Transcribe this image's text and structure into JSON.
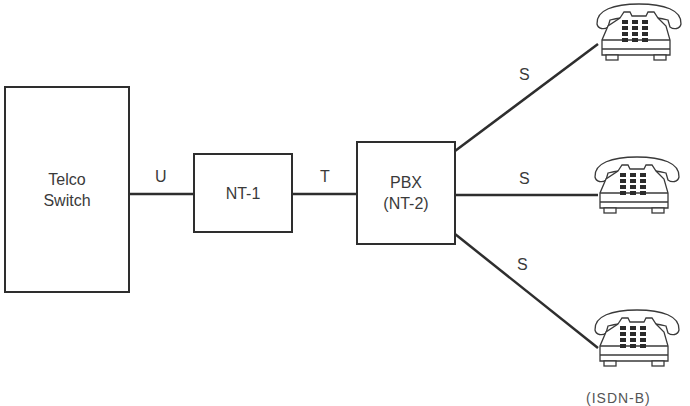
{
  "diagram": {
    "type": "isdn-reference-points",
    "nodes": {
      "telco_switch": {
        "lines": [
          "Telco",
          "Switch"
        ]
      },
      "nt1": {
        "lines": [
          "NT-1"
        ]
      },
      "pbx": {
        "lines": [
          "PBX",
          "(NT-2)"
        ]
      },
      "phones": [
        {
          "id": "phone-top",
          "icon": "telephone-icon"
        },
        {
          "id": "phone-middle",
          "icon": "telephone-icon"
        },
        {
          "id": "phone-bottom",
          "icon": "telephone-icon"
        }
      ]
    },
    "links": [
      {
        "from": "telco_switch",
        "to": "nt1",
        "label": "U"
      },
      {
        "from": "nt1",
        "to": "pbx",
        "label": "T"
      },
      {
        "from": "pbx",
        "to": "phone-top",
        "label": "S"
      },
      {
        "from": "pbx",
        "to": "phone-middle",
        "label": "S"
      },
      {
        "from": "pbx",
        "to": "phone-bottom",
        "label": "S"
      }
    ],
    "caption": "(ISDN-B)",
    "colors": {
      "stroke": "#2e2e2e",
      "text": "#3a3a3a",
      "background": "#ffffff"
    }
  }
}
